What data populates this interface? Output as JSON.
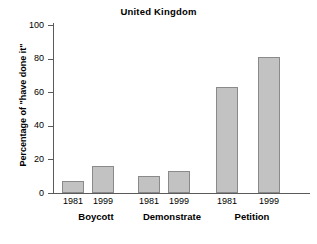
{
  "chart_data": {
    "type": "bar",
    "title": "United Kingdom",
    "xlabel": "",
    "ylabel": "Percentage of \"have done it\"",
    "ylim": [
      0,
      100
    ],
    "yticks": [
      0,
      20,
      40,
      60,
      80,
      100
    ],
    "grid": false,
    "legend": "none",
    "categories": [
      "Boycott",
      "Demonstrate",
      "Petition"
    ],
    "subcategories": [
      "1981",
      "1999"
    ],
    "series": [
      {
        "name": "1981",
        "values": [
          7,
          10,
          63
        ]
      },
      {
        "name": "1999",
        "values": [
          16,
          13,
          81
        ]
      }
    ],
    "bars": [
      {
        "group": "Boycott",
        "year": "1981",
        "value": 7
      },
      {
        "group": "Boycott",
        "year": "1999",
        "value": 16
      },
      {
        "group": "Demonstrate",
        "year": "1981",
        "value": 10
      },
      {
        "group": "Demonstrate",
        "year": "1999",
        "value": 13
      },
      {
        "group": "Petition",
        "year": "1981",
        "value": 63
      },
      {
        "group": "Petition",
        "year": "1999",
        "value": 81
      }
    ],
    "colors": {
      "bar_fill": "#c2c2c2",
      "bar_border": "#8a8a8a",
      "axis": "#5a5a5a",
      "text": "#000000",
      "background": "#ffffff"
    }
  },
  "axis": {
    "tick_labels": [
      "100",
      "80",
      "60",
      "40",
      "20",
      "0"
    ]
  },
  "groups": [
    {
      "label": "Boycott",
      "years": [
        "1981",
        "1999"
      ]
    },
    {
      "label": "Demonstrate",
      "years": [
        "1981",
        "1999"
      ]
    },
    {
      "label": "Petition",
      "years": [
        "1981",
        "1999"
      ]
    }
  ]
}
